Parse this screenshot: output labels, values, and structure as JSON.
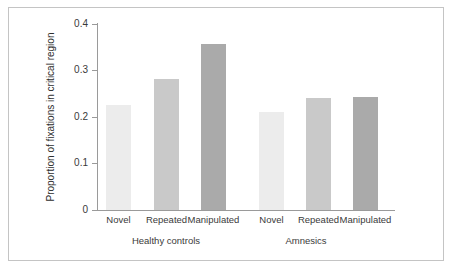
{
  "chart_data": {
    "type": "bar",
    "title": "",
    "subtitle": "",
    "xlabel": "",
    "ylabel": "Proportion of fixations in critical region",
    "ylim": [
      0,
      0.4
    ],
    "yticks": [
      "0",
      "0.1",
      "0.2",
      "0.3",
      "0.4"
    ],
    "ytick_values": [
      0,
      0.1,
      0.2,
      0.3,
      0.4
    ],
    "grid": false,
    "legend": "none",
    "categories": [
      "Novel",
      "Repeated",
      "Manipulated",
      "Novel",
      "Repeated",
      "Manipulated"
    ],
    "values": [
      0.225,
      0.281,
      0.355,
      0.211,
      0.241,
      0.243
    ],
    "groups": [
      {
        "label": "Healthy controls",
        "categories": [
          "Novel",
          "Repeated",
          "Manipulated"
        ],
        "values": [
          0.225,
          0.281,
          0.355
        ]
      },
      {
        "label": "Amnesics",
        "categories": [
          "Novel",
          "Repeated",
          "Manipulated"
        ],
        "values": [
          0.211,
          0.241,
          0.243
        ]
      }
    ],
    "bar_colors": [
      "#ececec",
      "#c9c9c9",
      "#aaaaaa",
      "#ececec",
      "#c9c9c9",
      "#aaaaaa"
    ],
    "colors": {
      "novel": "#ececec",
      "repeated": "#c9c9c9",
      "manipulated": "#aaaaaa",
      "axis": "#9a9a9a",
      "frame": "#c4c4c4",
      "text": "#3a3a3a",
      "background": "#ffffff"
    }
  },
  "axis": {
    "y_label": "Proportion of fixations in critical region",
    "ticks": [
      {
        "label": "0",
        "value": 0
      },
      {
        "label": "0.1",
        "value": 0.1
      },
      {
        "label": "0.2",
        "value": 0.2
      },
      {
        "label": "0.3",
        "value": 0.3
      },
      {
        "label": "0.4",
        "value": 0.4
      }
    ]
  },
  "bars": [
    {
      "label": "Novel",
      "value": 0.225,
      "color": "#ececec",
      "left": 106,
      "width": 25
    },
    {
      "label": "Repeated",
      "value": 0.281,
      "color": "#c9c9c9",
      "left": 154,
      "width": 25
    },
    {
      "label": "Manipulated",
      "value": 0.355,
      "color": "#aaaaaa",
      "left": 201,
      "width": 25
    },
    {
      "label": "Novel",
      "value": 0.211,
      "color": "#ececec",
      "left": 259,
      "width": 25
    },
    {
      "label": "Repeated",
      "value": 0.241,
      "color": "#c9c9c9",
      "left": 306,
      "width": 25
    },
    {
      "label": "Manipulated",
      "value": 0.243,
      "color": "#aaaaaa",
      "left": 353,
      "width": 25
    }
  ],
  "group_labels": [
    {
      "label": "Healthy controls",
      "center": 166
    },
    {
      "label": "Amnesics",
      "center": 306
    }
  ]
}
